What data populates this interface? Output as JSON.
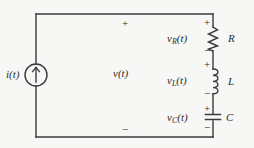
{
  "figure": {
    "kind": "circuit-schematic",
    "background_color": "#f7f7f5",
    "line_color": "#3a3a3a"
  },
  "source": {
    "label": "i(t)",
    "symbol": "current-source",
    "arrow_direction": "up"
  },
  "port": {
    "label": "v(t)",
    "plus": "+",
    "minus": "−"
  },
  "branch": {
    "elements": [
      {
        "name": "resistor",
        "designator": "R",
        "voltage_var": "v",
        "voltage_sub": "R",
        "voltage_arg": "(t)",
        "plus": "+",
        "minus": "−"
      },
      {
        "name": "inductor",
        "designator": "L",
        "voltage_var": "v",
        "voltage_sub": "L",
        "voltage_arg": "(t)",
        "plus": "+",
        "minus": "−"
      },
      {
        "name": "capacitor",
        "designator": "C",
        "voltage_var": "v",
        "voltage_sub": "C",
        "voltage_arg": "(t)",
        "plus": "+",
        "minus": "−"
      }
    ]
  }
}
